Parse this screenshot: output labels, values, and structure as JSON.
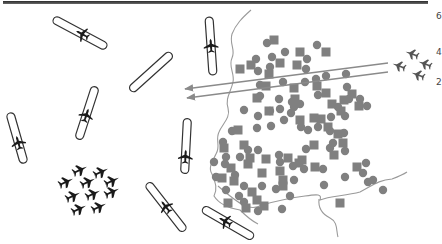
{
  "figure": {
    "colors": {
      "background": "#ffffff",
      "outline": "#333333",
      "aircraft": "#1a1a1a",
      "target_unit": "#808080",
      "border_line": "#9a9a9a",
      "arrow": "#8a8a8a",
      "top_bar": "#3a3a3a"
    }
  },
  "edge_labels": [
    "6",
    "4",
    "2"
  ],
  "runways": [
    {
      "cx": 80,
      "cy": 33,
      "len": 60,
      "angle": 28,
      "has_aircraft": true,
      "aircraft_pos": 0.55
    },
    {
      "cx": 151,
      "cy": 72,
      "len": 55,
      "angle": -42,
      "has_aircraft": false
    },
    {
      "cx": 211,
      "cy": 46,
      "len": 58,
      "angle": 86,
      "has_aircraft": true,
      "aircraft_pos": 0.5
    },
    {
      "cx": 87,
      "cy": 113,
      "len": 55,
      "angle": 108,
      "has_aircraft": true,
      "aircraft_pos": 0.55
    },
    {
      "cx": 186,
      "cy": 146,
      "len": 55,
      "angle": 93,
      "has_aircraft": true,
      "aircraft_pos": 0.7
    },
    {
      "cx": 17,
      "cy": 138,
      "len": 52,
      "angle": 74,
      "has_aircraft": true,
      "aircraft_pos": 0.6
    },
    {
      "cx": 166,
      "cy": 207,
      "len": 60,
      "angle": 52,
      "has_aircraft": true,
      "aircraft_pos": 0.5
    },
    {
      "cx": 228,
      "cy": 223,
      "len": 58,
      "angle": 30,
      "has_aircraft": true,
      "aircraft_pos": 0.45
    }
  ],
  "fighter_formation": [
    {
      "x": 80,
      "y": 170
    },
    {
      "x": 101,
      "y": 172
    },
    {
      "x": 66,
      "y": 182
    },
    {
      "x": 88,
      "y": 182
    },
    {
      "x": 112,
      "y": 181
    },
    {
      "x": 73,
      "y": 196
    },
    {
      "x": 93,
      "y": 194
    },
    {
      "x": 112,
      "y": 192
    },
    {
      "x": 79,
      "y": 209
    },
    {
      "x": 99,
      "y": 207
    }
  ],
  "attack_jets": [
    {
      "x": 412,
      "y": 54
    },
    {
      "x": 399,
      "y": 66
    },
    {
      "x": 425,
      "y": 64
    },
    {
      "x": 418,
      "y": 75
    }
  ],
  "arrows": [
    {
      "x1": 388,
      "y1": 63,
      "x2": 185,
      "y2": 89
    },
    {
      "x1": 388,
      "y1": 72,
      "x2": 187,
      "y2": 98
    }
  ],
  "targets": {
    "circles": [
      [
        267,
        43
      ],
      [
        285,
        52
      ],
      [
        317,
        45
      ],
      [
        272,
        57
      ],
      [
        256,
        59
      ],
      [
        258,
        71
      ],
      [
        270,
        67
      ],
      [
        307,
        59
      ],
      [
        306,
        69
      ],
      [
        316,
        79
      ],
      [
        326,
        76
      ],
      [
        260,
        85
      ],
      [
        260,
        96
      ],
      [
        279,
        99
      ],
      [
        283,
        82
      ],
      [
        305,
        82
      ],
      [
        346,
        74
      ],
      [
        347,
        87
      ],
      [
        360,
        99
      ],
      [
        244,
        110
      ],
      [
        257,
        128
      ],
      [
        271,
        126
      ],
      [
        280,
        109
      ],
      [
        291,
        113
      ],
      [
        294,
        107
      ],
      [
        292,
        102
      ],
      [
        270,
        111
      ],
      [
        258,
        116
      ],
      [
        225,
        164
      ],
      [
        232,
        131
      ],
      [
        300,
        104
      ],
      [
        318,
        95
      ],
      [
        331,
        117
      ],
      [
        338,
        107
      ],
      [
        345,
        116
      ],
      [
        349,
        99
      ],
      [
        344,
        133
      ],
      [
        330,
        131
      ],
      [
        333,
        143
      ],
      [
        345,
        151
      ],
      [
        306,
        149
      ],
      [
        301,
        127
      ],
      [
        308,
        130
      ],
      [
        318,
        127
      ],
      [
        304,
        169
      ],
      [
        235,
        175
      ],
      [
        262,
        186
      ],
      [
        282,
        209
      ],
      [
        294,
        180
      ],
      [
        324,
        185
      ],
      [
        345,
        177
      ],
      [
        363,
        173
      ],
      [
        290,
        196
      ],
      [
        258,
        211
      ],
      [
        244,
        186
      ],
      [
        239,
        196
      ],
      [
        244,
        202
      ],
      [
        226,
        190
      ],
      [
        223,
        142
      ],
      [
        214,
        162
      ],
      [
        216,
        177
      ],
      [
        226,
        157
      ],
      [
        240,
        157
      ],
      [
        248,
        150
      ],
      [
        258,
        150
      ],
      [
        279,
        155
      ],
      [
        280,
        162
      ],
      [
        293,
        166
      ],
      [
        366,
        163
      ],
      [
        368,
        182
      ],
      [
        383,
        190
      ],
      [
        373,
        180
      ],
      [
        330,
        148
      ],
      [
        323,
        169
      ],
      [
        276,
        189
      ],
      [
        284,
        120
      ],
      [
        367,
        106
      ]
    ],
    "squares": [
      [
        274,
        40
      ],
      [
        300,
        52
      ],
      [
        326,
        52
      ],
      [
        280,
        63
      ],
      [
        297,
        65
      ],
      [
        251,
        65
      ],
      [
        240,
        69
      ],
      [
        269,
        74
      ],
      [
        266,
        86
      ],
      [
        294,
        88
      ],
      [
        317,
        86
      ],
      [
        295,
        99
      ],
      [
        257,
        98
      ],
      [
        326,
        93
      ],
      [
        344,
        100
      ],
      [
        332,
        104
      ],
      [
        352,
        94
      ],
      [
        359,
        106
      ],
      [
        341,
        111
      ],
      [
        328,
        127
      ],
      [
        238,
        130
      ],
      [
        269,
        111
      ],
      [
        300,
        120
      ],
      [
        314,
        118
      ],
      [
        224,
        148
      ],
      [
        222,
        178
      ],
      [
        231,
        168
      ],
      [
        248,
        164
      ],
      [
        266,
        159
      ],
      [
        244,
        145
      ],
      [
        288,
        158
      ],
      [
        262,
        173
      ],
      [
        280,
        171
      ],
      [
        302,
        160
      ],
      [
        338,
        134
      ],
      [
        343,
        143
      ],
      [
        283,
        180
      ],
      [
        234,
        181
      ],
      [
        252,
        192
      ],
      [
        246,
        208
      ],
      [
        264,
        206
      ],
      [
        228,
        203
      ],
      [
        250,
        158
      ],
      [
        340,
        203
      ],
      [
        257,
        200
      ],
      [
        315,
        167
      ],
      [
        299,
        163
      ],
      [
        283,
        186
      ],
      [
        314,
        145
      ],
      [
        334,
        155
      ],
      [
        357,
        167
      ],
      [
        321,
        119
      ]
    ]
  },
  "border": {
    "coast_path": "M251,10 C242,18 236,24 232,34 C229,44 236,50 232,58 C228,66 235,74 233,82 C231,92 225,98 228,108 C231,118 222,124 219,132 C215,140 221,146 216,154 C212,162 208,168 212,174 C215,182 218,188 214,196 C219,204 228,208 240,210 C246,216 250,220 258,224",
    "bottom_path": "M212,180 C218,190 224,196 232,198 C238,206 245,212 256,207 C262,212 270,206 280,205 C292,201 300,196 310,198 C318,197 322,196 322,200",
    "river_path": "M218,186 C240,205 250,212 262,205 C280,200 290,198 305,196 C318,194 322,194 320,200 C330,196 345,196 360,192 C372,186 378,180 392,179 C400,176 404,174 407,172",
    "river_branch": "M319,199 C318,208 322,214 330,218 C338,222 336,230 338,237"
  }
}
